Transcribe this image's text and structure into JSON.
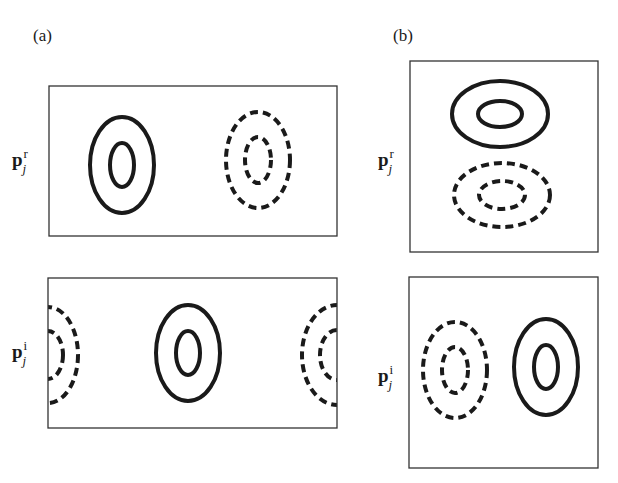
{
  "figure": {
    "panels": [
      {
        "id": "a",
        "label": "(a)",
        "rows": [
          {
            "label_base": "p",
            "label_sup": "r",
            "label_sub": "j",
            "box": {
              "x": 49,
              "y": 86,
              "w": 288,
              "h": 150
            },
            "contours": [
              {
                "style": "solid",
                "cx": 122,
                "cy": 165,
                "rx": 32,
                "ry": 48
              },
              {
                "style": "solid",
                "cx": 122,
                "cy": 165,
                "rx": 12,
                "ry": 22
              },
              {
                "style": "dashed",
                "cx": 258,
                "cy": 160,
                "rx": 32,
                "ry": 48
              },
              {
                "style": "dashed",
                "cx": 258,
                "cy": 160,
                "rx": 13,
                "ry": 23
              }
            ]
          },
          {
            "label_base": "p",
            "label_sup": "i",
            "label_sub": "j",
            "box": {
              "x": 48,
              "y": 278,
              "w": 289,
              "h": 150
            },
            "contours": [
              {
                "style": "dashed",
                "cx": 48,
                "cy": 355,
                "rx": 30,
                "ry": 48
              },
              {
                "style": "dashed",
                "cx": 48,
                "cy": 355,
                "rx": 15,
                "ry": 24
              },
              {
                "style": "solid",
                "cx": 188,
                "cy": 353,
                "rx": 32,
                "ry": 48
              },
              {
                "style": "solid",
                "cx": 188,
                "cy": 353,
                "rx": 12,
                "ry": 22
              },
              {
                "style": "dashed",
                "cx": 337,
                "cy": 355,
                "rx": 35,
                "ry": 50
              },
              {
                "style": "dashed",
                "cx": 337,
                "cy": 355,
                "rx": 17,
                "ry": 25
              }
            ]
          }
        ]
      },
      {
        "id": "b",
        "label": "(b)",
        "rows": [
          {
            "label_base": "p",
            "label_sup": "r",
            "label_sub": "j",
            "box": {
              "x": 410,
              "y": 61,
              "w": 188,
              "h": 191
            },
            "contours": [
              {
                "style": "solid",
                "cx": 500,
                "cy": 114,
                "rx": 48,
                "ry": 33
              },
              {
                "style": "solid",
                "cx": 500,
                "cy": 114,
                "rx": 22,
                "ry": 13
              },
              {
                "style": "dashed",
                "cx": 502,
                "cy": 195,
                "rx": 48,
                "ry": 32
              },
              {
                "style": "dashed",
                "cx": 502,
                "cy": 195,
                "rx": 23,
                "ry": 14
              }
            ]
          },
          {
            "label_base": "p",
            "label_sup": "i",
            "label_sub": "j",
            "box": {
              "x": 409,
              "y": 277,
              "w": 189,
              "h": 191
            },
            "contours": [
              {
                "style": "dashed",
                "cx": 455,
                "cy": 370,
                "rx": 32,
                "ry": 48
              },
              {
                "style": "dashed",
                "cx": 455,
                "cy": 370,
                "rx": 13,
                "ry": 23
              },
              {
                "style": "solid",
                "cx": 546,
                "cy": 367,
                "rx": 32,
                "ry": 48
              },
              {
                "style": "solid",
                "cx": 546,
                "cy": 367,
                "rx": 12,
                "ry": 22
              }
            ]
          }
        ]
      }
    ],
    "colors": {
      "stroke": "#1a1a1a",
      "box": "#333333",
      "background": "#ffffff"
    }
  }
}
